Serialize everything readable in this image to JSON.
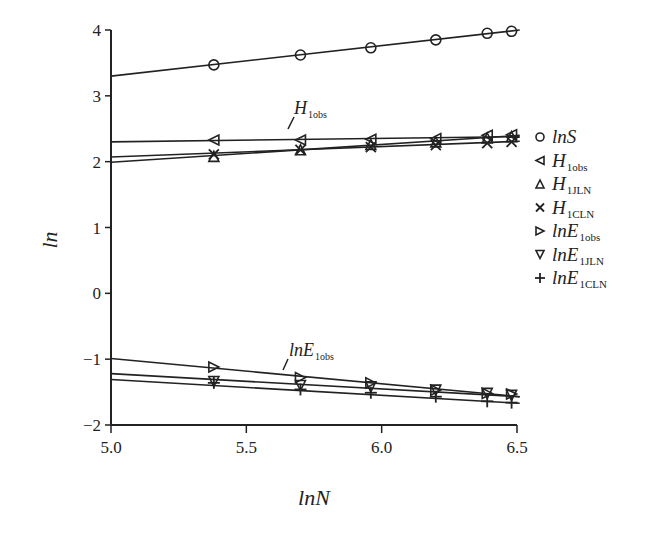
{
  "chart_data": {
    "type": "line",
    "title": "",
    "xlabel": "lnN",
    "ylabel": "ln",
    "xlim": [
      5.0,
      6.5
    ],
    "ylim": [
      -2,
      4
    ],
    "xticks": [
      "5.0",
      "5.5",
      "6.0",
      "6.5"
    ],
    "yticks": [
      "4",
      "3",
      "2",
      "1",
      "0",
      "−1",
      "−2"
    ],
    "grid": false,
    "legend_position": "right",
    "x": [
      5.38,
      5.7,
      5.96,
      6.2,
      6.39,
      6.48
    ],
    "series": [
      {
        "name": "lnS",
        "main": "lnS",
        "sub": "",
        "marker": "circle",
        "values": [
          3.47,
          3.62,
          3.73,
          3.85,
          3.95,
          3.98
        ],
        "fit": [
          3.3,
          4.0
        ]
      },
      {
        "name": "H1obs",
        "main": "H",
        "sub": "1obs",
        "marker": "triangle-left",
        "values": [
          2.33,
          2.33,
          2.34,
          2.35,
          2.4,
          2.41
        ],
        "fit": [
          2.3,
          2.38
        ]
      },
      {
        "name": "H1JLN",
        "main": "H",
        "sub": "1JLN",
        "marker": "triangle-up",
        "values": [
          2.08,
          2.18,
          2.26,
          2.3,
          2.36,
          2.38
        ],
        "fit": [
          1.99,
          2.4
        ]
      },
      {
        "name": "H1CLN",
        "main": "H",
        "sub": "1CLN",
        "marker": "x",
        "values": [
          2.11,
          2.18,
          2.22,
          2.25,
          2.28,
          2.3
        ],
        "fit": [
          2.07,
          2.31
        ]
      },
      {
        "name": "lnE1obs",
        "main": "lnE",
        "sub": "1obs",
        "marker": "triangle-right",
        "values": [
          -1.12,
          -1.28,
          -1.36,
          -1.47,
          -1.52,
          -1.53
        ],
        "fit": [
          -0.99,
          -1.57
        ]
      },
      {
        "name": "lnE1JLN",
        "main": "lnE",
        "sub": "1JLN",
        "marker": "triangle-down",
        "values": [
          -1.34,
          -1.4,
          -1.42,
          -1.47,
          -1.52,
          -1.55
        ],
        "fit": [
          -1.22,
          -1.57
        ]
      },
      {
        "name": "lnE1CLN",
        "main": "lnE",
        "sub": "1CLN",
        "marker": "plus",
        "values": [
          -1.36,
          -1.46,
          -1.51,
          -1.57,
          -1.64,
          -1.66
        ],
        "fit": [
          -1.31,
          -1.67
        ]
      }
    ],
    "annotations": [
      {
        "main": "H",
        "sub": "1obs",
        "near_x": 5.62,
        "near_y": 2.33
      },
      {
        "main": "lnE",
        "sub": "1obs",
        "near_x": 5.62,
        "near_y": -1.3
      }
    ]
  },
  "labels": {
    "xlabel": "lnN",
    "ylabel": "ln",
    "annot_h_main": "H",
    "annot_h_sub": "1obs",
    "annot_e_main": "lnE",
    "annot_e_sub": "1obs"
  }
}
